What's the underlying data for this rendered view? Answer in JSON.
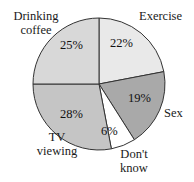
{
  "figure": {
    "width": 194,
    "height": 182,
    "background": "#ffffff"
  },
  "chart_data": {
    "type": "pie",
    "title": "",
    "subtitle": "",
    "xlabel": "",
    "ylabel": "",
    "grid": false,
    "legend_position": "none",
    "label_style": "outside category names with inside percentage labels",
    "start_angle_deg": 0,
    "direction": "clockwise",
    "center": {
      "cx": 99,
      "cy": 84
    },
    "radius": 66,
    "stroke_color": "#333333",
    "categories": [
      "Exercise",
      "Sex",
      "Don't know",
      "TV viewing",
      "Drinking coffee"
    ],
    "values": [
      22,
      19,
      6,
      28,
      25
    ],
    "value_labels": [
      "22%",
      "19%",
      "6%",
      "28%",
      "25%"
    ],
    "colors": [
      "#e9e9e9",
      "#a9a9a9",
      "#ffffff",
      "#c5c5c5",
      "#d8d8d8"
    ],
    "slices": [
      {
        "name": "Exercise",
        "value": 22,
        "value_label": "22%",
        "color": "#e9e9e9",
        "start_deg": 0,
        "end_deg": 79.2,
        "label_line1": "Exercise",
        "label_line2": ""
      },
      {
        "name": "Sex",
        "value": 19,
        "value_label": "19%",
        "color": "#a9a9a9",
        "start_deg": 79.2,
        "end_deg": 147.6,
        "label_line1": "Sex",
        "label_line2": ""
      },
      {
        "name": "Don't know",
        "value": 6,
        "value_label": "6%",
        "color": "#ffffff",
        "start_deg": 147.6,
        "end_deg": 169.2,
        "label_line1": "Don't",
        "label_line2": "know"
      },
      {
        "name": "TV viewing",
        "value": 28,
        "value_label": "28%",
        "color": "#c5c5c5",
        "start_deg": 169.2,
        "end_deg": 270.0,
        "label_line1": "TV",
        "label_line2": "viewing"
      },
      {
        "name": "Drinking coffee",
        "value": 25,
        "value_label": "25%",
        "color": "#d8d8d8",
        "start_deg": 270.0,
        "end_deg": 360.0,
        "label_line1": "Drinking",
        "label_line2": "coffee"
      }
    ]
  }
}
